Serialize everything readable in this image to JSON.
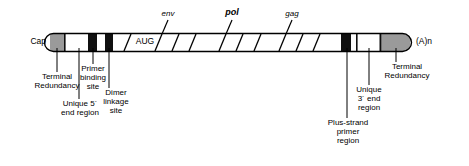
{
  "figure": {
    "type": "genome-map-diagram",
    "colors": {
      "outline": "#000000",
      "fill_white": "#ffffff",
      "fill_black": "#101010",
      "fill_grey": "#9a9a9a",
      "text": "#000000"
    }
  },
  "ends": {
    "left_label": "Cap",
    "right_label": "(A)n"
  },
  "genes": [
    {
      "name": "env",
      "style": "italic"
    },
    {
      "name": "pol",
      "style": "italic-bold"
    },
    {
      "name": "gag",
      "style": "italic"
    }
  ],
  "inline_labels": [
    {
      "name": "start-codon",
      "text": "AUG"
    }
  ],
  "segments": [
    {
      "name": "terminal-redundancy-5prime",
      "fill": "grey"
    },
    {
      "name": "unique-5prime-end-region",
      "fill": "white"
    },
    {
      "name": "primer-binding-site",
      "fill": "black"
    },
    {
      "name": "spacer-a",
      "fill": "white"
    },
    {
      "name": "dimer-linkage-site",
      "fill": "black"
    },
    {
      "name": "spacer-b",
      "fill": "white"
    },
    {
      "name": "coding-region",
      "fill": "white"
    },
    {
      "name": "plus-strand-primer-region",
      "fill": "black"
    },
    {
      "name": "spacer-c",
      "fill": "white"
    },
    {
      "name": "unique-3prime-end-region",
      "fill": "white"
    },
    {
      "name": "terminal-redundancy-3prime",
      "fill": "grey"
    }
  ],
  "callouts": {
    "terminal_redundancy_left": "Terminal\nRedundancy",
    "unique_5_end_region": "Unique 5´\nend region",
    "primer_binding_site": "Primer\nbinding\nsite",
    "dimer_linkage_site": "Dimer\nlinkage\nsite",
    "plus_strand_primer_region": "Plus-strand\nprimer\nregion",
    "unique_3_end_region": "Unique\n3´ end\nregion",
    "terminal_redundancy_right": "Terminal\nRedundancy"
  }
}
